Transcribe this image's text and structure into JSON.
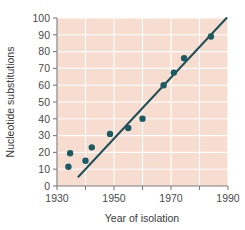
{
  "chart_data": {
    "type": "scatter",
    "title": "",
    "xlabel": "Year of isolation",
    "ylabel": "Nucleotide substitutions",
    "xlim": [
      1930,
      1990
    ],
    "ylim": [
      0,
      100
    ],
    "grid": true,
    "legend": null,
    "x_major_ticks": [
      1930,
      1950,
      1970,
      1990
    ],
    "x_minor_ticks": [
      1940,
      1960,
      1980
    ],
    "x_tick_labels": [
      "1930",
      "1950",
      "1970",
      "1990"
    ],
    "y_ticks": [
      0,
      10,
      20,
      30,
      40,
      50,
      60,
      70,
      80,
      90,
      100
    ],
    "y_tick_labels": [
      "0",
      "10",
      "20",
      "30",
      "40",
      "50",
      "60",
      "70",
      "80",
      "90",
      "100"
    ],
    "points": [
      {
        "x": 1934.0,
        "y": 11.5
      },
      {
        "x": 1934.6,
        "y": 19.5
      },
      {
        "x": 1940.0,
        "y": 15.0
      },
      {
        "x": 1942.2,
        "y": 23.0
      },
      {
        "x": 1948.6,
        "y": 31.0
      },
      {
        "x": 1955.0,
        "y": 34.5
      },
      {
        "x": 1960.0,
        "y": 40.0
      },
      {
        "x": 1967.4,
        "y": 60.0
      },
      {
        "x": 1971.0,
        "y": 67.5
      },
      {
        "x": 1974.6,
        "y": 76.0
      },
      {
        "x": 1984.0,
        "y": 89.0
      }
    ],
    "trend_line": {
      "name": "linear regression fit",
      "x_start": 1937.5,
      "y_start": 5.5,
      "x_end": 1989.5,
      "y_end": 100.0
    },
    "colors": {
      "plot_background": "#f7ddd0",
      "gridline": "#ffffff",
      "data_point": "#1b5b63",
      "trend_line": "#1d4f58",
      "axis": "#7d7d7d",
      "tick_label": "#4a4a4a",
      "axis_title": "#3a3a3a",
      "page_background": "#ffffff"
    }
  }
}
